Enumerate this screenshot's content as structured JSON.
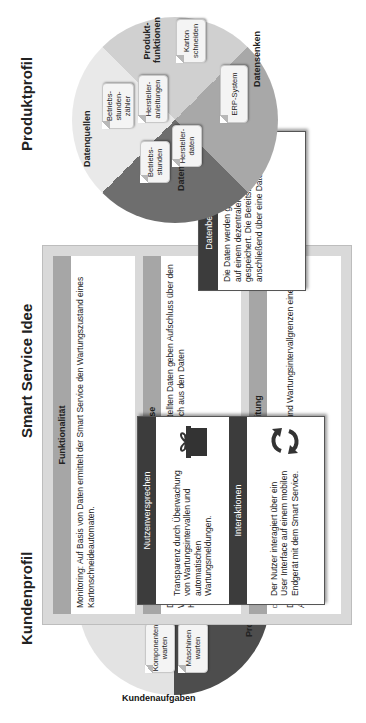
{
  "titles": {
    "kundenprofil": "Kundenprofil",
    "smart_service_idee": "Smart Service Idee",
    "produktprofil": "Produktprofil"
  },
  "kundenprofil": {
    "segments": {
      "gewinne": "Gewinne",
      "probleme": "Probleme",
      "kundenaufgaben": "Kundenaufgaben"
    },
    "notes": {
      "autom_wartungsmeldung": "Autom. Wartungs-meldung",
      "transparenter_wartungsprozess": "Transpa-renter Wartungs-prozess",
      "undurchsichtiger_wartungszustand": "Undurchsichtiger Wartungszustand",
      "komponenten_warten": "Komponenten warten",
      "maschinen_warten": "Maschinen warten"
    }
  },
  "smart_service": {
    "funktionalitaet": {
      "header": "Funktionalität",
      "text": "Monitoring: Auf Basis von Daten ermittelt der Smart Service den Wartungszustand eines Kartonschneideautomaten."
    },
    "erkenntnisse": {
      "header": "Erkenntnisse",
      "text": "Die durch den Wartungsmonitor zur Verfügung gestellten Daten geben Aufschluss über den Wartungszustand der Anlagen. Zusätzlich lassen sich aus den Daten Handlungsempfehlungen vom Nutzer ableiten."
    },
    "datenverarbeitung": {
      "header": "Datenverarbeitung",
      "options": [
        {
          "label": "Deskriptiv",
          "checked": false,
          "has_box": false
        },
        {
          "label": "Diagnos-tisch",
          "checked": true,
          "has_box": true
        },
        {
          "label": "Präskriptiv",
          "checked": false,
          "has_box": true
        },
        {
          "label": "Prä-skriptiv",
          "checked": false,
          "has_box": true
        }
      ],
      "text": "Durch einen Soll-Ist-Vergleich der Nutzungsdaten und Wartungsintervallgrenzen einer Anlage wird ein Wartungsbedarf diagnostiziert."
    },
    "nutzenversprechen": {
      "header": "Nutzenversprechen",
      "icon": "gift-icon",
      "text": "Transparenz durch Überwachung von Wartungsintervallen und automatischen Wartungsmeldungen."
    },
    "interaktionen": {
      "header": "Interaktionen",
      "icon": "refresh-cycle-icon",
      "text": "Der Nutzer interagiert über ein User Interface auf einem mobilen Endgerät mit dem Smart Service."
    },
    "datenbereitstellung": {
      "header": "Datenbereitstellung",
      "icon": "network-hub-icon",
      "text": "Die Daten werden gesammelt und auf einem dezentralen Server gespeichert. Die Bereitstellung erfolgt anschließend über eine Daten-Cloud."
    }
  },
  "produktprofil": {
    "segments": {
      "datenquellen": "Datenquellen",
      "produktfunktionen": "Produkt-funktionen",
      "datensenken": "Datensenken",
      "daten": "Daten"
    },
    "notes": {
      "betriebsstundenzaehler": "Betriebs-stunden-zähler",
      "herstelleranleitungen": "Hersteller-anleitungen",
      "karton_schneiden": "Karton schneiden",
      "erp_system": "ERP-System",
      "betriebsstunden": "Betriebs-stunden",
      "herstellerdaten": "Hersteller-daten"
    }
  },
  "colors": {
    "segment_light": "#e6e6e6",
    "segment_mid": "#c9c9c9",
    "segment_dark": "#7a7a7a",
    "segment_darkest": "#5a5a5a",
    "card_header": "#a6a6a6",
    "popup_header": "#3c3c3c",
    "frame": "#d9d9d9"
  }
}
